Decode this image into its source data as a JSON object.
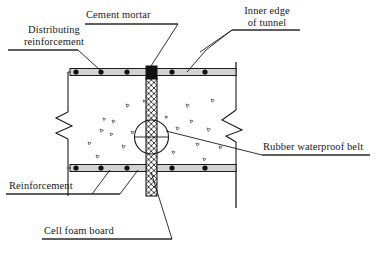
{
  "figure": {
    "type": "engineering-cross-section",
    "background_color": "#ffffff",
    "line_color": "#1a1a1a"
  },
  "labels": {
    "distributing_reinforcement": "Distributing\nreinforcement",
    "distributing_reinforcement_line1": "Distributing",
    "distributing_reinforcement_line2": "reinforcement",
    "cement_mortar": "Cement mortar",
    "inner_edge_of_tunnel": "Inner edge\nof tunnel",
    "inner_edge_line1": "Inner edge",
    "inner_edge_line2": "of tunnel",
    "rubber_waterproof_belt": "Rubber waterproof belt",
    "reinforcement": "Reinforcement",
    "cell_foam_board": "Cell foam board"
  },
  "components": {
    "concrete_body": {
      "name": "concrete-lining-section",
      "fill": "#ffffff",
      "hatch_marks": "aggregate-triangles"
    },
    "joint_filler": {
      "name": "cell-foam-board-joint",
      "pattern": "cross-hatch",
      "width_px": 11
    },
    "mortar_cap": {
      "name": "cement-mortar-block",
      "fill": "#111111"
    },
    "waterproof_belt": {
      "name": "rubber-waterproof-belt-circle",
      "shape": "circle",
      "radius_px": 17
    },
    "rebar_top": {
      "name": "top-reinforcement-bar",
      "node_count_left": 3,
      "node_count_right": 2
    },
    "rebar_bottom": {
      "name": "bottom-reinforcement-bar",
      "node_count_left": 3,
      "node_count_right": 2
    },
    "break_lines": {
      "name": "zigzag-break-lines",
      "count": 2
    }
  },
  "colors": {
    "ink": "#1a1a1a",
    "mortar": "#111111",
    "rebar_fill": "#c8c8c8",
    "paper": "#ffffff"
  }
}
